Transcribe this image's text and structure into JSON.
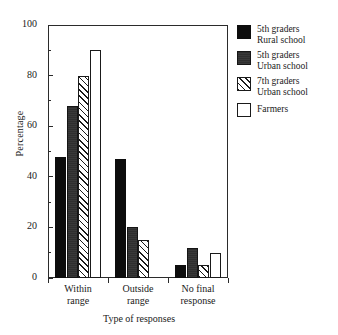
{
  "chart_data": {
    "type": "bar",
    "title": "",
    "xlabel": "Type of responses",
    "ylabel": "Percentage",
    "categories": [
      "Within\nrange",
      "Outside\nrange",
      "No final\nresponse"
    ],
    "category_lines": [
      [
        "Within",
        "range"
      ],
      [
        "Outside",
        "range"
      ],
      [
        "No final",
        "response"
      ]
    ],
    "series": [
      {
        "name": "5th graders Rural school",
        "legend_lines": [
          "5th graders",
          "Rural school"
        ],
        "pattern": "solid-black",
        "color": "#0d0d0d",
        "values": [
          48,
          47,
          5
        ]
      },
      {
        "name": "5th graders Urban school",
        "legend_lines": [
          "5th graders",
          "Urban school"
        ],
        "pattern": "dark-fill",
        "color": "#2e2e2e",
        "values": [
          68,
          20,
          12
        ]
      },
      {
        "name": "7th graders Urban school",
        "legend_lines": [
          "7th graders",
          "Urban school"
        ],
        "pattern": "diagonal-hatch",
        "color": "#ffffff",
        "values": [
          80,
          15,
          5
        ]
      },
      {
        "name": "Farmers",
        "legend_lines": [
          "Farmers"
        ],
        "pattern": "white-open",
        "color": "#ffffff",
        "values": [
          90,
          null,
          10
        ]
      }
    ],
    "ylim": [
      0,
      100
    ],
    "yticks": [
      0,
      20,
      40,
      60,
      80,
      100
    ],
    "yticks_minor": [
      10,
      30,
      50,
      70,
      90
    ],
    "ytick_labels": [
      "0",
      "20",
      "40",
      "60",
      "80",
      "100"
    ],
    "grid": false,
    "legend_position": "right-top"
  },
  "axis": {
    "y_title": "Percentage",
    "x_title": "Type of responses"
  }
}
